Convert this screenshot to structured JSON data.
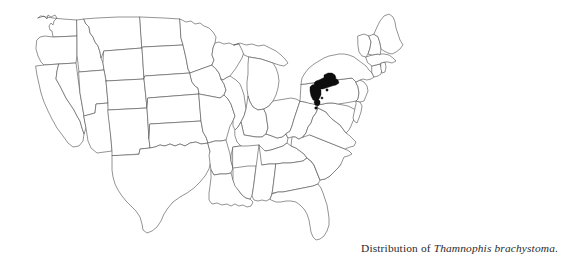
{
  "figure": {
    "kind": "distribution-map",
    "region": "United States of America",
    "background_color": "#ffffff",
    "outline_color": "#5a5a5a",
    "range_fill_color": "#0d0d0d"
  },
  "caption": {
    "prefix": "Distribution of ",
    "species": "Thamnophis brachystoma",
    "suffix": ".",
    "full_text": "Distribution of Thamnophis brachystoma."
  },
  "map": {
    "title": "",
    "projection_note": "",
    "states": [
      {
        "code": "WA",
        "name": "Washington"
      },
      {
        "code": "OR",
        "name": "Oregon"
      },
      {
        "code": "CA",
        "name": "California"
      },
      {
        "code": "NV",
        "name": "Nevada"
      },
      {
        "code": "ID",
        "name": "Idaho"
      },
      {
        "code": "MT",
        "name": "Montana"
      },
      {
        "code": "WY",
        "name": "Wyoming"
      },
      {
        "code": "UT",
        "name": "Utah"
      },
      {
        "code": "AZ",
        "name": "Arizona"
      },
      {
        "code": "CO",
        "name": "Colorado"
      },
      {
        "code": "NM",
        "name": "New Mexico"
      },
      {
        "code": "ND",
        "name": "North Dakota"
      },
      {
        "code": "SD",
        "name": "South Dakota"
      },
      {
        "code": "NE",
        "name": "Nebraska"
      },
      {
        "code": "KS",
        "name": "Kansas"
      },
      {
        "code": "OK",
        "name": "Oklahoma"
      },
      {
        "code": "TX",
        "name": "Texas"
      },
      {
        "code": "MN",
        "name": "Minnesota"
      },
      {
        "code": "IA",
        "name": "Iowa"
      },
      {
        "code": "MO",
        "name": "Missouri"
      },
      {
        "code": "AR",
        "name": "Arkansas"
      },
      {
        "code": "LA",
        "name": "Louisiana"
      },
      {
        "code": "WI",
        "name": "Wisconsin"
      },
      {
        "code": "IL",
        "name": "Illinois"
      },
      {
        "code": "MS",
        "name": "Mississippi"
      },
      {
        "code": "MI",
        "name": "Michigan"
      },
      {
        "code": "IN",
        "name": "Indiana"
      },
      {
        "code": "KY",
        "name": "Kentucky"
      },
      {
        "code": "TN",
        "name": "Tennessee"
      },
      {
        "code": "AL",
        "name": "Alabama"
      },
      {
        "code": "OH",
        "name": "Ohio"
      },
      {
        "code": "WV",
        "name": "West Virginia"
      },
      {
        "code": "GA",
        "name": "Georgia"
      },
      {
        "code": "FL",
        "name": "Florida"
      },
      {
        "code": "SC",
        "name": "South Carolina"
      },
      {
        "code": "NC",
        "name": "North Carolina"
      },
      {
        "code": "VA",
        "name": "Virginia"
      },
      {
        "code": "MD",
        "name": "Maryland"
      },
      {
        "code": "DE",
        "name": "Delaware"
      },
      {
        "code": "PA",
        "name": "Pennsylvania"
      },
      {
        "code": "NJ",
        "name": "New Jersey"
      },
      {
        "code": "NY",
        "name": "New York"
      },
      {
        "code": "CT",
        "name": "Connecticut"
      },
      {
        "code": "RI",
        "name": "Rhode Island"
      },
      {
        "code": "MA",
        "name": "Massachusetts"
      },
      {
        "code": "VT",
        "name": "Vermont"
      },
      {
        "code": "NH",
        "name": "New Hampshire"
      },
      {
        "code": "ME",
        "name": "Maine"
      }
    ],
    "range_description": "Solid black range shading centered on northwestern Pennsylvania and adjacent southwestern New York, with several small outlying spots to the south and west in Pennsylvania.",
    "range_states": [
      "Pennsylvania",
      "New York"
    ]
  }
}
